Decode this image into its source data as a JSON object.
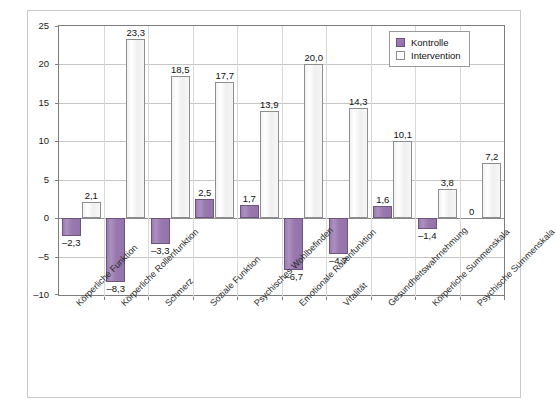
{
  "chart_data": {
    "type": "bar",
    "title": "",
    "xlabel": "",
    "ylabel": "Score Punkte",
    "ylim": [
      -10,
      25
    ],
    "ytick_step": 5,
    "yticks": [
      "25",
      "20",
      "15",
      "10",
      "5",
      "0",
      "-5",
      "-10"
    ],
    "grid": true,
    "legend_position": "top-right",
    "categories": [
      "Körperliche Funktion",
      "Körperliche Rollenfunktion",
      "Schmerz",
      "Soziale Funktion",
      "Psychisches Wohlbefinden",
      "Emotionale Rollenfunktion",
      "Vitalität",
      "Gesundheitswahrnehmung",
      "Körperliche Summenskala",
      "Psychische Summenskala"
    ],
    "series": [
      {
        "name": "Kontrolle",
        "color": "#9878ae",
        "values": [
          -2.3,
          -8.3,
          -3.3,
          2.5,
          1.7,
          -6.7,
          -4.7,
          1.6,
          -1.4,
          0
        ],
        "labels": [
          "–2,3",
          "–8,3",
          "–3,3",
          "2,5",
          "1,7",
          "–6,7",
          "–4,7",
          "1,6",
          "–1,4",
          "0"
        ]
      },
      {
        "name": "Intervention",
        "color": "#ffffff",
        "values": [
          2.1,
          23.3,
          18.5,
          17.7,
          13.9,
          20.0,
          14.3,
          10.1,
          3.8,
          7.2
        ],
        "labels": [
          "2,1",
          "23,3",
          "18,5",
          "17,7",
          "13,9",
          "20,0",
          "14,3",
          "10,1",
          "3,8",
          "7,2"
        ]
      }
    ]
  },
  "legend": {
    "items": [
      {
        "label": "Kontrolle",
        "swatch": "filled-purple"
      },
      {
        "label": "Intervention",
        "swatch": "empty-white"
      }
    ]
  },
  "axis": {
    "y_label": "Score Punkte"
  }
}
